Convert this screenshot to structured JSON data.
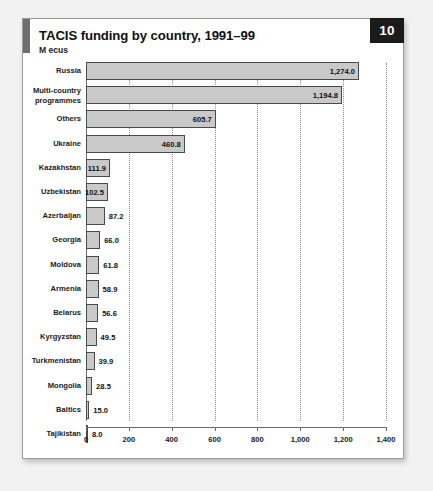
{
  "card": {
    "title": "TACIS funding by country, 1991–99",
    "subtitle": "M ecus",
    "page_badge": "10"
  },
  "colors": {
    "bar_fill": "#c9c9c9",
    "bar_border": "#4a4a4a",
    "badge_bg": "#1b1b1b",
    "accent": "#6e6e6e",
    "gridline": "#8d8d8d"
  },
  "chart_data": {
    "type": "bar",
    "orientation": "horizontal",
    "title": "TACIS funding by country, 1991–99",
    "subtitle": "M ecus",
    "xlabel": "",
    "ylabel": "",
    "xlim": [
      0,
      1400
    ],
    "xticks": [
      0,
      200,
      400,
      600,
      800,
      1000,
      1200,
      1400
    ],
    "xticklabels": [
      "0",
      "200",
      "400",
      "600",
      "800",
      "1,000",
      "1,200",
      "1,400"
    ],
    "grid": true,
    "legend": false,
    "categories": [
      "Russia",
      "Multi-country programmes",
      "Others",
      "Ukraine",
      "Kazakhstan",
      "Uzbekistan",
      "Azerbaijan",
      "Georgia",
      "Moldova",
      "Armenia",
      "Belarus",
      "Kyrgyzstan",
      "Turkmenistan",
      "Mongolia",
      "Baltics",
      "Tajikistan"
    ],
    "values": [
      1274.0,
      1194.8,
      605.7,
      460.8,
      111.9,
      102.5,
      87.2,
      66.0,
      61.8,
      58.9,
      56.6,
      49.5,
      39.9,
      28.5,
      15.0,
      8.0
    ],
    "value_labels": [
      "1,274.0",
      "1,194.8",
      "605.7",
      "460.8",
      "111.9",
      "102.5",
      "87.2",
      "66.0",
      "61.8",
      "58.9",
      "56.6",
      "49.5",
      "39.9",
      "28.5",
      "15.0",
      "8.0"
    ]
  },
  "rows": [
    {
      "label_lines": [
        "Russia"
      ],
      "value": 1274.0,
      "value_label": "1,274.0",
      "inside": true
    },
    {
      "label_lines": [
        "Multi-country",
        "programmes"
      ],
      "value": 1194.8,
      "value_label": "1,194.8",
      "inside": true
    },
    {
      "label_lines": [
        "Others"
      ],
      "value": 605.7,
      "value_label": "605.7",
      "inside": true
    },
    {
      "label_lines": [
        "Ukraine"
      ],
      "value": 460.8,
      "value_label": "460.8",
      "inside": true
    },
    {
      "label_lines": [
        "Kazakhstan"
      ],
      "value": 111.9,
      "value_label": "111.9",
      "inside": true
    },
    {
      "label_lines": [
        "Uzbekistan"
      ],
      "value": 102.5,
      "value_label": "102.5",
      "inside": true
    },
    {
      "label_lines": [
        "Azerbaijan"
      ],
      "value": 87.2,
      "value_label": "87.2",
      "inside": false
    },
    {
      "label_lines": [
        "Georgia"
      ],
      "value": 66.0,
      "value_label": "66.0",
      "inside": false
    },
    {
      "label_lines": [
        "Moldova"
      ],
      "value": 61.8,
      "value_label": "61.8",
      "inside": false
    },
    {
      "label_lines": [
        "Armenia"
      ],
      "value": 58.9,
      "value_label": "58.9",
      "inside": false
    },
    {
      "label_lines": [
        "Belarus"
      ],
      "value": 56.6,
      "value_label": "56.6",
      "inside": false
    },
    {
      "label_lines": [
        "Kyrgyzstan"
      ],
      "value": 49.5,
      "value_label": "49.5",
      "inside": false
    },
    {
      "label_lines": [
        "Turkmenistan"
      ],
      "value": 39.9,
      "value_label": "39.9",
      "inside": false
    },
    {
      "label_lines": [
        "Mongolia"
      ],
      "value": 28.5,
      "value_label": "28.5",
      "inside": false
    },
    {
      "label_lines": [
        "Baltics"
      ],
      "value": 15.0,
      "value_label": "15.0",
      "inside": false
    },
    {
      "label_lines": [
        "Tajikistan"
      ],
      "value": 8.0,
      "value_label": "8.0",
      "inside": false
    }
  ]
}
